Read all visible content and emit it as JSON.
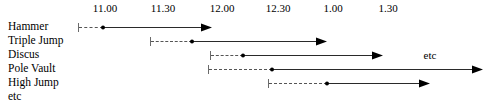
{
  "chart_data": {
    "type": "bar",
    "title": "",
    "subtitle": "",
    "xlabel": "",
    "ylabel": "",
    "grid": false,
    "legend": null,
    "orientation": "horizontal",
    "axis": {
      "position": "top",
      "tick_labels": [
        "11.00",
        "11.30",
        "12.00",
        "12.30",
        "1.00",
        "1.30"
      ],
      "tick_x_px": [
        105,
        163,
        222,
        278,
        333,
        388
      ],
      "spacing_px": 56.6,
      "unit": "clock time",
      "range_label_first": "11.00",
      "range_label_last": "1.30"
    },
    "categories": [
      "Hammer",
      "Triple Jump",
      "Discus",
      "Pole Vault",
      "High Jump",
      "etc"
    ],
    "rows": [
      {
        "label": "Hammer",
        "label_y_px": 26,
        "bar_y_px": 27,
        "has_bar": true,
        "tick_x_px": 78,
        "dot_x_px": 103,
        "arrow_tip_x_px": 212,
        "dashed_start_time": "10.50",
        "event_start_time": "11.00",
        "event_end_time": "11.55"
      },
      {
        "label": "Triple Jump",
        "label_y_px": 40,
        "bar_y_px": 41,
        "has_bar": true,
        "tick_x_px": 150,
        "dot_x_px": 192,
        "arrow_tip_x_px": 327,
        "dashed_start_time": "11.24",
        "event_start_time": "11.46",
        "event_end_time": "12.57"
      },
      {
        "label": "Discus",
        "label_y_px": 54,
        "bar_y_px": 55,
        "has_bar": true,
        "tick_x_px": 210,
        "dot_x_px": 243,
        "arrow_tip_x_px": 383,
        "dashed_start_time": "11.56",
        "event_start_time": "12.13",
        "event_end_time": "1.27"
      },
      {
        "label": "Pole Vault",
        "label_y_px": 68,
        "bar_y_px": 69,
        "has_bar": true,
        "tick_x_px": 208,
        "dot_x_px": 272,
        "arrow_tip_x_px": 483,
        "dashed_start_time": "11.55",
        "event_start_time": "12.28",
        "event_end_time": "2.00"
      },
      {
        "label": "High Jump",
        "label_y_px": 82,
        "bar_y_px": 83,
        "has_bar": true,
        "tick_x_px": 268,
        "dot_x_px": 327,
        "arrow_tip_x_px": 430,
        "dashed_start_time": "12.25",
        "event_start_time": "12.56",
        "event_end_time": "1.50"
      },
      {
        "label": "etc",
        "label_y_px": 96,
        "bar_y_px": 97,
        "has_bar": false,
        "tick_x_px": null,
        "dot_x_px": null,
        "arrow_tip_x_px": null
      }
    ],
    "annotations": [
      {
        "text": "etc",
        "x_px": 430,
        "y_px": 55,
        "attached_row": "Discus"
      }
    ],
    "colors": {
      "background": "#ffffff",
      "text": "#000000",
      "solid_line": "#2a2a2a",
      "dashed_line": "#555555",
      "tick_mark": "#6b6b6b",
      "dot": "#000000",
      "arrowhead": "#000000"
    }
  }
}
